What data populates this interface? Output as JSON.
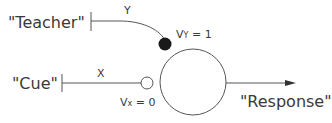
{
  "diagram": {
    "teacher_label": "\"Teacher\"",
    "cue_label": "\"Cue\"",
    "response_label": "\"Response\"",
    "y_label": "Y",
    "x_label": "X",
    "vy_label": "V",
    "vy_sub": "Y",
    "vy_value": " = 1",
    "vx_label": "V",
    "vx_sub": "x",
    "vx_value": " = 0",
    "colors": {
      "line": "#555555",
      "text": "#3a3a3a",
      "filled_node": "#1a1a1a"
    }
  }
}
